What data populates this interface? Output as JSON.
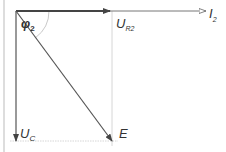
{
  "diagram": {
    "type": "phasor-diagram",
    "colors": {
      "vector": "#555555",
      "thick_vector": "#444444",
      "guide": "#cccccc",
      "border": "#bbbbbb",
      "text": "#333333"
    },
    "vectors": [
      {
        "id": "U_R2",
        "main": "U",
        "sub": "R2",
        "from": [
          16,
          11
        ],
        "to": [
          110,
          11
        ]
      },
      {
        "id": "I_2",
        "main": "I",
        "sub": "2",
        "from": [
          110,
          11
        ],
        "to": [
          206,
          11
        ]
      },
      {
        "id": "U_C",
        "main": "U",
        "sub": "C",
        "from": [
          16,
          11
        ],
        "to": [
          16,
          141
        ]
      },
      {
        "id": "E",
        "main": "E",
        "sub": "",
        "from": [
          16,
          11
        ],
        "to": [
          112,
          141
        ]
      }
    ],
    "angle": {
      "main": "φ",
      "sub": "2",
      "radius": 33
    },
    "labels": {
      "ur2_main": "U",
      "ur2_sub": "R2",
      "i2_main": "I",
      "i2_sub": "2",
      "uc_main": "U",
      "uc_sub": "C",
      "e_main": "E",
      "phi_main": "φ",
      "phi_sub": "2"
    }
  }
}
